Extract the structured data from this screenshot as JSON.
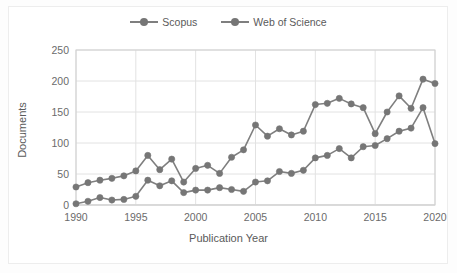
{
  "chart_data": {
    "type": "line",
    "title": "",
    "xlabel": "Publication Year",
    "ylabel": "Documents",
    "xlim": [
      1990,
      2020
    ],
    "ylim": [
      0,
      250
    ],
    "ytick_labels": [
      "0",
      "50",
      "100",
      "150",
      "200",
      "250"
    ],
    "yticks": [
      0,
      50,
      100,
      150,
      200,
      250
    ],
    "xtick_labels": [
      "1990",
      "1995",
      "2000",
      "2005",
      "2010",
      "2015",
      "2020"
    ],
    "xticks": [
      1990,
      1995,
      2000,
      2005,
      2010,
      2015,
      2020
    ],
    "grid": "horizontal-and-vertical",
    "legend_position": "top-center",
    "x": [
      1990,
      1991,
      1992,
      1993,
      1994,
      1995,
      1996,
      1997,
      1998,
      1999,
      2000,
      2001,
      2002,
      2003,
      2004,
      2005,
      2006,
      2007,
      2008,
      2009,
      2010,
      2011,
      2012,
      2013,
      2014,
      2015,
      2016,
      2017,
      2018,
      2019,
      2020
    ],
    "series": [
      {
        "name": "Scopus",
        "color": "#7f7f7f",
        "values": [
          29,
          36,
          40,
          43,
          47,
          55,
          80,
          57,
          74,
          37,
          59,
          64,
          51,
          77,
          89,
          129,
          111,
          123,
          113,
          119,
          162,
          164,
          172,
          163,
          157,
          115,
          150,
          176,
          156,
          203,
          196
        ]
      },
      {
        "name": "Web of Science",
        "color": "#7f7f7f",
        "values": [
          2,
          6,
          12,
          8,
          9,
          14,
          40,
          31,
          39,
          20,
          24,
          24,
          28,
          25,
          22,
          37,
          39,
          54,
          51,
          56,
          76,
          80,
          91,
          76,
          94,
          96,
          107,
          119,
          124,
          157,
          99
        ]
      }
    ]
  },
  "legend": {
    "entries": [
      {
        "label": "Scopus"
      },
      {
        "label": "Web of Science"
      }
    ]
  },
  "axes": {
    "x_title": "Publication Year",
    "y_title": "Documents"
  }
}
